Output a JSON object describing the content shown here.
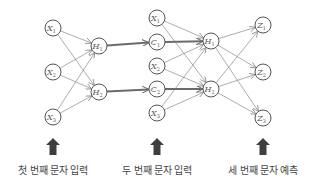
{
  "colors": {
    "node_stroke": "#555555",
    "edge": "#8a8a8a",
    "thick_edge": "#6b6b6b",
    "up_arrow": "#3f3f3f",
    "caption": "#444444"
  },
  "nodes": {
    "first_inputs": [
      {
        "id": "x1a",
        "letter": "X",
        "sub": "1",
        "cx": 53,
        "cy": 28
      },
      {
        "id": "x2a",
        "letter": "X",
        "sub": "2",
        "cx": 53,
        "cy": 72
      },
      {
        "id": "x3a",
        "letter": "X",
        "sub": "3",
        "cx": 53,
        "cy": 117
      }
    ],
    "first_hidden": [
      {
        "id": "h1a",
        "letter": "H",
        "sub": "1",
        "cx": 99,
        "cy": 46
      },
      {
        "id": "h2a",
        "letter": "H",
        "sub": "2",
        "cx": 99,
        "cy": 92
      }
    ],
    "second_inputs": [
      {
        "id": "x1b",
        "letter": "X",
        "sub": "1",
        "cx": 157,
        "cy": 18
      },
      {
        "id": "c1",
        "letter": "C",
        "sub": "1",
        "cx": 157,
        "cy": 42
      },
      {
        "id": "x2b",
        "letter": "X",
        "sub": "2",
        "cx": 157,
        "cy": 66
      },
      {
        "id": "c2",
        "letter": "C",
        "sub": "2",
        "cx": 157,
        "cy": 89
      },
      {
        "id": "x3b",
        "letter": "X",
        "sub": "3",
        "cx": 157,
        "cy": 113
      }
    ],
    "second_hidden": [
      {
        "id": "h1b",
        "letter": "H",
        "sub": "1",
        "cx": 211,
        "cy": 41
      },
      {
        "id": "h2b",
        "letter": "H",
        "sub": "2",
        "cx": 211,
        "cy": 89
      }
    ],
    "outputs": [
      {
        "id": "z1",
        "letter": "Z",
        "sub": "1",
        "cx": 263,
        "cy": 25
      },
      {
        "id": "z2",
        "letter": "Z",
        "sub": "2",
        "cx": 263,
        "cy": 72
      },
      {
        "id": "z3",
        "letter": "Z",
        "sub": "3",
        "cx": 263,
        "cy": 118
      }
    ]
  },
  "edges": {
    "thin": [
      [
        "x1a",
        "h1a"
      ],
      [
        "x1a",
        "h2a"
      ],
      [
        "x2a",
        "h1a"
      ],
      [
        "x2a",
        "h2a"
      ],
      [
        "x3a",
        "h1a"
      ],
      [
        "x3a",
        "h2a"
      ],
      [
        "x1b",
        "h1b"
      ],
      [
        "x1b",
        "h2b"
      ],
      [
        "x2b",
        "h1b"
      ],
      [
        "x2b",
        "h2b"
      ],
      [
        "x3b",
        "h1b"
      ],
      [
        "x3b",
        "h2b"
      ],
      [
        "h1b",
        "z1"
      ],
      [
        "h1b",
        "z2"
      ],
      [
        "h1b",
        "z3"
      ],
      [
        "h2b",
        "z1"
      ],
      [
        "h2b",
        "z2"
      ],
      [
        "h2b",
        "z3"
      ]
    ],
    "thick": [
      [
        "h1a",
        "c1"
      ],
      [
        "h2a",
        "c2"
      ],
      [
        "c1",
        "h1b"
      ],
      [
        "c2",
        "h2b"
      ]
    ]
  },
  "up_arrows": [
    {
      "id": "arrow-first",
      "x": 53
    },
    {
      "id": "arrow-second",
      "x": 157
    },
    {
      "id": "arrow-third",
      "x": 263
    }
  ],
  "captions": {
    "first": "첫 번째 문자 입력",
    "second": "두 번째 문자 입력",
    "third": "세 번째 문자 예측"
  }
}
